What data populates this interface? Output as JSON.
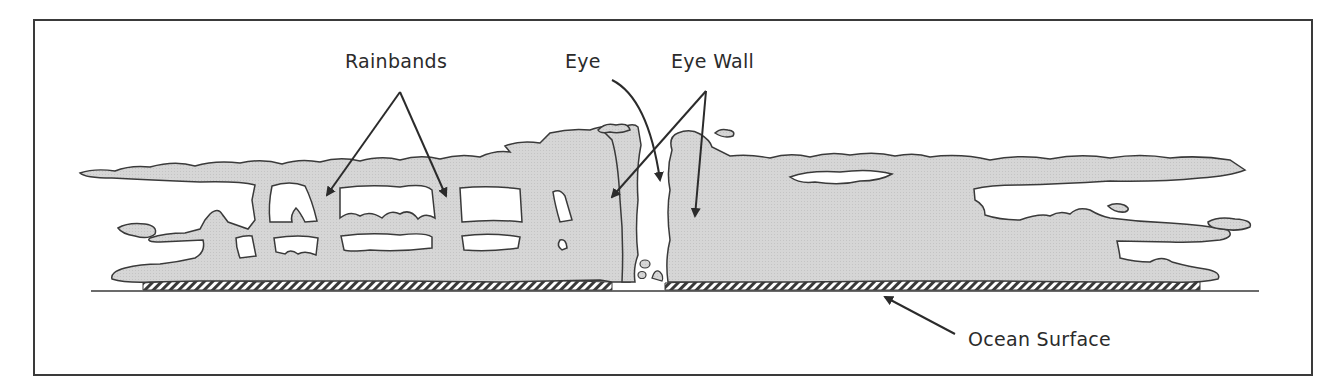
{
  "diagram": {
    "labels": {
      "rainbands": "Rainbands",
      "eye": "Eye",
      "eye_wall": "Eye Wall",
      "ocean_surface": "Ocean Surface"
    },
    "colors": {
      "cloud_fill": "#d4d4d4",
      "outline": "#3a3a3a",
      "background": "#ffffff",
      "frame": "#3a3a3a"
    }
  }
}
